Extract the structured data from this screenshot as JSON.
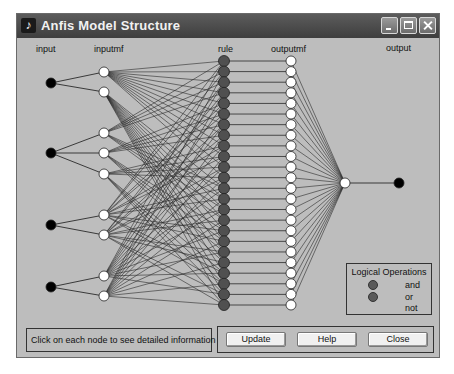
{
  "window": {
    "title": "Anfis Model Structure",
    "controls": {
      "minimize": "minimize",
      "maximize": "maximize",
      "close": "close"
    }
  },
  "columns": {
    "input": "input",
    "inputmf": "inputmf",
    "rule": "rule",
    "outputmf": "outputmf",
    "output": "output"
  },
  "network": {
    "inputs": [
      {
        "name": "input1",
        "mf_count": 2
      },
      {
        "name": "input2",
        "mf_count": 3
      },
      {
        "name": "input3",
        "mf_count": 2
      },
      {
        "name": "input4",
        "mf_count": 2
      }
    ],
    "rule_count": 24,
    "outputmf_count": 24,
    "output_count": 1,
    "colors": {
      "input_node": "#000000",
      "mf_node": "#ffffff",
      "rule_node": "#505050",
      "output_node": "#000000",
      "edge": "#2a2a2a"
    }
  },
  "legend": {
    "title": "Logical Operations",
    "items": [
      {
        "label": "and",
        "color": "#505050"
      },
      {
        "label": "or",
        "color": "#505050"
      },
      {
        "label": "not"
      }
    ]
  },
  "status": {
    "message": "Click on each node to see detailed information"
  },
  "buttons": {
    "update": "Update",
    "help": "Help",
    "close": "Close"
  }
}
